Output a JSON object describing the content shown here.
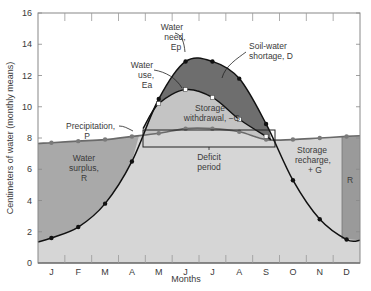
{
  "chart_data": {
    "type": "line",
    "title": "",
    "xlabel": "Months",
    "ylabel": "Centimeters of water (monthly means)",
    "ylim": [
      0,
      16
    ],
    "yticks": [
      0,
      2,
      4,
      6,
      8,
      10,
      12,
      14,
      16
    ],
    "categories": [
      "J",
      "F",
      "M",
      "A",
      "M",
      "J",
      "J",
      "A",
      "S",
      "O",
      "N",
      "D"
    ],
    "grid": false,
    "series": [
      {
        "name": "Water need, Ep",
        "values": [
          1.6,
          2.3,
          3.8,
          6.5,
          10.5,
          12.9,
          12.9,
          11.8,
          8.9,
          5.3,
          2.8,
          1.5
        ]
      },
      {
        "name": "Water use, Ea",
        "values": [
          null,
          null,
          null,
          null,
          10.2,
          11.1,
          10.6,
          9.2,
          8.1,
          null,
          null,
          null
        ]
      },
      {
        "name": "Precipitation, P",
        "values": [
          7.7,
          7.8,
          7.9,
          8.1,
          8.3,
          8.6,
          8.6,
          8.4,
          7.9,
          7.9,
          8.0,
          8.1
        ]
      }
    ],
    "annotations": [
      "Water need, Ep",
      "Water use, Ea",
      "Soil-water shortage, D",
      "Precipitation, P",
      "Storage withdrawal, −G",
      "Water surplus, R",
      "Deficit period",
      "Storage recharge, +G",
      "R"
    ],
    "colors": {
      "surplus": "#a9a9a9",
      "shortage": "#6e6e6e",
      "withdrawal": "#c4c4c4",
      "base": "#d6d6d6",
      "line": "#111111",
      "precip_line": "#6a6a6a"
    }
  },
  "labels": {
    "need": [
      "Water",
      "need,",
      "Ep"
    ],
    "use": [
      "Water",
      "use,",
      "Ea"
    ],
    "shortage": [
      "Soil-water",
      "shortage, D"
    ],
    "precip": [
      "Precipitation,",
      "P"
    ],
    "withdrawal": [
      "Storage",
      "withdrawal, −G"
    ],
    "surplus": [
      "Water",
      "surplus,",
      "R"
    ],
    "deficit": [
      "Deficit",
      "period"
    ],
    "recharge": [
      "Storage",
      "recharge,",
      "+ G"
    ],
    "r_small": "R",
    "xlabel": "Months",
    "ylabel": "Centimeters of water (monthly means)"
  }
}
